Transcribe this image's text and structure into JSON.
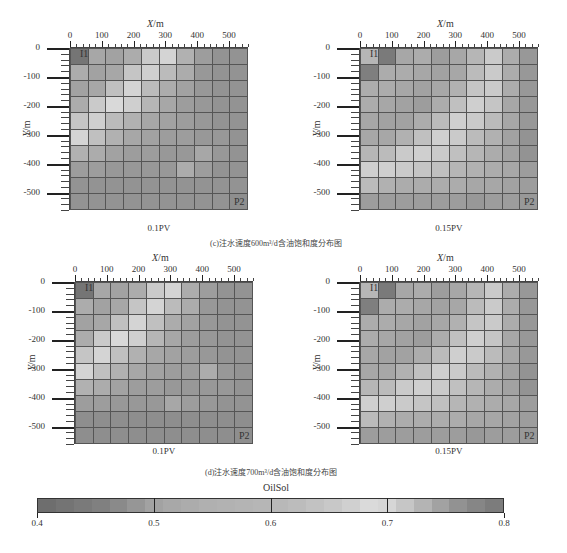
{
  "figure": {
    "caption_c": "(c)注水速度600m³/d含油饱和度分布图",
    "caption_d": "(d)注水速度700m³/d含油饱和度分布图"
  },
  "axes": {
    "x_label": "X",
    "x_unit": "/m",
    "y_label": "Y",
    "y_unit": "/m",
    "x_ticks": [
      "0",
      "100",
      "200",
      "300",
      "400",
      "500"
    ],
    "y_ticks": [
      "0",
      "-100",
      "-200",
      "-300",
      "-400",
      "-500"
    ]
  },
  "wells": {
    "injector": "I1",
    "producer": "P2"
  },
  "colorbar": {
    "title": "OilSol",
    "ticks": [
      "0.4",
      "0.5",
      "0.6",
      "0.7",
      "0.8"
    ],
    "colors": [
      "#6e6e6e",
      "#747474",
      "#7a7a7a",
      "#808080",
      "#8a8a8a",
      "#969696",
      "#a2a2a2",
      "#a8a8a8",
      "#acacac",
      "#b0b0b0",
      "#b2b2b2",
      "#b4b4b4",
      "#b6b6b6",
      "#b8b8b8",
      "#bcbcbc",
      "#c2c2c2",
      "#c8c8c8",
      "#d0d0d0",
      "#dadada",
      "#d6d6d6",
      "#c6c6c6",
      "#b4b4b4",
      "#a2a2a2",
      "#929292",
      "#868686",
      "#7c7c7c"
    ]
  },
  "panels": [
    {
      "id": "c-0.1",
      "label": "0.1PV"
    },
    {
      "id": "c-0.15",
      "label": "0.15PV"
    },
    {
      "id": "d-0.1",
      "label": "0.1PV"
    },
    {
      "id": "d-0.15",
      "label": "0.15PV"
    }
  ],
  "chart_data": [
    {
      "type": "heatmap",
      "title": "0.1PV (600m³/d)",
      "xlabel": "X/m",
      "ylabel": "Y/m",
      "xlim": [
        0,
        560
      ],
      "ylim": [
        -560,
        0
      ],
      "values": [
        [
          0.45,
          0.55,
          0.54,
          0.56,
          0.62,
          0.64,
          0.57,
          0.53,
          0.51,
          0.51
        ],
        [
          0.56,
          0.54,
          0.55,
          0.61,
          0.63,
          0.59,
          0.56,
          0.52,
          0.51,
          0.51
        ],
        [
          0.54,
          0.55,
          0.6,
          0.64,
          0.59,
          0.56,
          0.54,
          0.52,
          0.51,
          0.51
        ],
        [
          0.56,
          0.62,
          0.65,
          0.63,
          0.58,
          0.55,
          0.53,
          0.52,
          0.51,
          0.51
        ],
        [
          0.61,
          0.63,
          0.59,
          0.57,
          0.55,
          0.54,
          0.53,
          0.52,
          0.51,
          0.51
        ],
        [
          0.64,
          0.6,
          0.57,
          0.55,
          0.54,
          0.53,
          0.53,
          0.52,
          0.52,
          0.51
        ],
        [
          0.57,
          0.56,
          0.54,
          0.53,
          0.53,
          0.52,
          0.52,
          0.55,
          0.52,
          0.51
        ],
        [
          0.53,
          0.53,
          0.52,
          0.52,
          0.52,
          0.52,
          0.56,
          0.53,
          0.51,
          0.51
        ],
        [
          0.51,
          0.51,
          0.51,
          0.51,
          0.51,
          0.51,
          0.51,
          0.51,
          0.51,
          0.51
        ],
        [
          0.51,
          0.51,
          0.51,
          0.51,
          0.51,
          0.51,
          0.51,
          0.51,
          0.51,
          0.5
        ]
      ]
    },
    {
      "type": "heatmap",
      "title": "0.15PV (600m³/d)",
      "xlabel": "X/m",
      "ylabel": "Y/m",
      "xlim": [
        0,
        560
      ],
      "ylim": [
        -560,
        0
      ],
      "values": [
        [
          0.58,
          0.46,
          0.55,
          0.56,
          0.53,
          0.55,
          0.58,
          0.62,
          0.56,
          0.52
        ],
        [
          0.47,
          0.56,
          0.56,
          0.55,
          0.54,
          0.55,
          0.59,
          0.62,
          0.56,
          0.52
        ],
        [
          0.56,
          0.56,
          0.55,
          0.54,
          0.55,
          0.57,
          0.61,
          0.62,
          0.56,
          0.52
        ],
        [
          0.56,
          0.55,
          0.54,
          0.53,
          0.56,
          0.6,
          0.63,
          0.61,
          0.55,
          0.52
        ],
        [
          0.55,
          0.54,
          0.54,
          0.56,
          0.59,
          0.63,
          0.62,
          0.59,
          0.55,
          0.52
        ],
        [
          0.55,
          0.55,
          0.57,
          0.6,
          0.63,
          0.62,
          0.59,
          0.57,
          0.54,
          0.51
        ],
        [
          0.58,
          0.59,
          0.62,
          0.63,
          0.62,
          0.6,
          0.58,
          0.56,
          0.54,
          0.51
        ],
        [
          0.63,
          0.63,
          0.62,
          0.61,
          0.6,
          0.58,
          0.57,
          0.56,
          0.55,
          0.53
        ],
        [
          0.59,
          0.57,
          0.56,
          0.56,
          0.56,
          0.56,
          0.55,
          0.55,
          0.54,
          0.53
        ],
        [
          0.53,
          0.53,
          0.53,
          0.53,
          0.53,
          0.53,
          0.52,
          0.53,
          0.53,
          0.52
        ]
      ]
    },
    {
      "type": "heatmap",
      "title": "0.1PV (700m³/d)",
      "xlabel": "X/m",
      "ylabel": "Y/m",
      "xlim": [
        0,
        560
      ],
      "ylim": [
        -560,
        0
      ],
      "values": [
        [
          0.45,
          0.55,
          0.54,
          0.56,
          0.62,
          0.64,
          0.56,
          0.53,
          0.51,
          0.51
        ],
        [
          0.56,
          0.54,
          0.55,
          0.61,
          0.64,
          0.59,
          0.56,
          0.52,
          0.51,
          0.51
        ],
        [
          0.54,
          0.55,
          0.6,
          0.64,
          0.6,
          0.56,
          0.54,
          0.52,
          0.51,
          0.51
        ],
        [
          0.56,
          0.62,
          0.65,
          0.63,
          0.58,
          0.55,
          0.53,
          0.52,
          0.51,
          0.51
        ],
        [
          0.61,
          0.64,
          0.6,
          0.57,
          0.55,
          0.54,
          0.53,
          0.52,
          0.51,
          0.51
        ],
        [
          0.64,
          0.6,
          0.57,
          0.55,
          0.54,
          0.53,
          0.53,
          0.56,
          0.52,
          0.51
        ],
        [
          0.57,
          0.56,
          0.54,
          0.53,
          0.53,
          0.52,
          0.52,
          0.52,
          0.52,
          0.51
        ],
        [
          0.53,
          0.53,
          0.52,
          0.52,
          0.52,
          0.55,
          0.53,
          0.52,
          0.51,
          0.51
        ],
        [
          0.5,
          0.5,
          0.5,
          0.5,
          0.5,
          0.5,
          0.5,
          0.5,
          0.5,
          0.5
        ],
        [
          0.5,
          0.5,
          0.5,
          0.5,
          0.5,
          0.5,
          0.5,
          0.5,
          0.5,
          0.5
        ]
      ]
    },
    {
      "type": "heatmap",
      "title": "0.15PV (700m³/d)",
      "xlabel": "X/m",
      "ylabel": "Y/m",
      "xlim": [
        0,
        560
      ],
      "ylim": [
        -560,
        0
      ],
      "values": [
        [
          0.58,
          0.46,
          0.55,
          0.56,
          0.53,
          0.55,
          0.58,
          0.62,
          0.56,
          0.52
        ],
        [
          0.47,
          0.56,
          0.56,
          0.55,
          0.54,
          0.55,
          0.59,
          0.62,
          0.56,
          0.52
        ],
        [
          0.56,
          0.56,
          0.55,
          0.54,
          0.55,
          0.57,
          0.61,
          0.62,
          0.56,
          0.52
        ],
        [
          0.56,
          0.55,
          0.54,
          0.53,
          0.56,
          0.6,
          0.63,
          0.61,
          0.55,
          0.52
        ],
        [
          0.55,
          0.54,
          0.54,
          0.56,
          0.59,
          0.63,
          0.62,
          0.59,
          0.55,
          0.52
        ],
        [
          0.55,
          0.55,
          0.57,
          0.6,
          0.63,
          0.62,
          0.59,
          0.57,
          0.54,
          0.51
        ],
        [
          0.58,
          0.59,
          0.62,
          0.63,
          0.62,
          0.6,
          0.58,
          0.56,
          0.54,
          0.51
        ],
        [
          0.63,
          0.63,
          0.62,
          0.61,
          0.6,
          0.58,
          0.57,
          0.56,
          0.55,
          0.53
        ],
        [
          0.59,
          0.57,
          0.56,
          0.56,
          0.56,
          0.56,
          0.55,
          0.55,
          0.54,
          0.53
        ],
        [
          0.53,
          0.53,
          0.53,
          0.53,
          0.53,
          0.53,
          0.52,
          0.53,
          0.53,
          0.52
        ]
      ]
    }
  ]
}
